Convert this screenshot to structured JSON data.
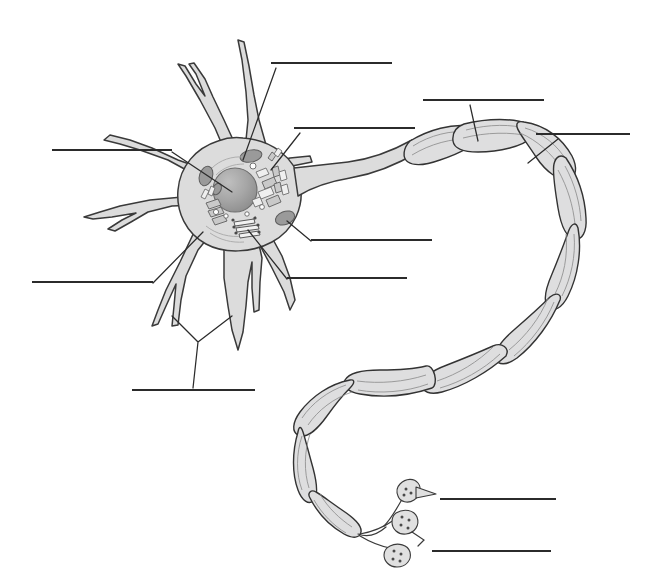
{
  "figure": {
    "background_color": "#ffffff",
    "line_color": "#2b2b2b",
    "cell_fill_color": "#dcdcdc",
    "organelle_dark_color": "#9a9a9a",
    "myelin_fill_color": "#dededf"
  },
  "label_lines": [
    {
      "id": "label-line-1",
      "text": "",
      "position": "top-center",
      "x1": 271,
      "y1": 63,
      "x2": 392,
      "y2": 63,
      "points_to": "dendrite"
    },
    {
      "id": "label-line-2",
      "text": "",
      "position": "upper-center-right",
      "x1": 294,
      "y1": 128,
      "x2": 415,
      "y2": 128,
      "points_to": "rough-endoplasmic-reticulum"
    },
    {
      "id": "label-line-3",
      "text": "",
      "position": "upper-right",
      "x1": 423,
      "y1": 100,
      "x2": 544,
      "y2": 100,
      "points_to": "myelin-sheath"
    },
    {
      "id": "label-line-4",
      "text": "",
      "position": "right",
      "x1": 536,
      "y1": 134,
      "x2": 630,
      "y2": 134,
      "points_to": "node-of-ranvier"
    },
    {
      "id": "label-line-5",
      "text": "",
      "position": "left-upper",
      "x1": 52,
      "y1": 150,
      "x2": 172,
      "y2": 150,
      "points_to": "nucleus"
    },
    {
      "id": "label-line-6",
      "text": "",
      "position": "center-right",
      "x1": 311,
      "y1": 240,
      "x2": 432,
      "y2": 240,
      "points_to": "mitochondrion"
    },
    {
      "id": "label-line-7",
      "text": "",
      "position": "center-right-lower",
      "x1": 287,
      "y1": 278,
      "x2": 407,
      "y2": 278,
      "points_to": "golgi-apparatus"
    },
    {
      "id": "label-line-8",
      "text": "",
      "position": "left-lower",
      "x1": 32,
      "y1": 282,
      "x2": 153,
      "y2": 282,
      "points_to": "cell-body-soma"
    },
    {
      "id": "label-line-9",
      "text": "",
      "position": "bottom-left",
      "x1": 132,
      "y1": 390,
      "x2": 255,
      "y2": 390,
      "points_to": "dendrites"
    },
    {
      "id": "label-line-10",
      "text": "",
      "position": "bottom-right-upper",
      "x1": 440,
      "y1": 499,
      "x2": 556,
      "y2": 499,
      "points_to": "axon-terminal"
    },
    {
      "id": "label-line-11",
      "text": "",
      "position": "bottom-right-lower",
      "x1": 432,
      "y1": 551,
      "x2": 551,
      "y2": 551,
      "points_to": "synaptic-knob"
    }
  ],
  "structures": [
    {
      "id": "cell-body",
      "name": "cell body (soma)"
    },
    {
      "id": "nucleus",
      "name": "nucleus"
    },
    {
      "id": "dendrites",
      "name": "dendrites",
      "count": 8
    },
    {
      "id": "axon-hillock",
      "name": "axon hillock"
    },
    {
      "id": "axon",
      "name": "axon"
    },
    {
      "id": "myelin-sheath",
      "name": "myelin sheath (Schwann cells)",
      "segments": 11
    },
    {
      "id": "node-of-ranvier",
      "name": "node of Ranvier"
    },
    {
      "id": "mitochondria",
      "name": "mitochondria",
      "count": 4
    },
    {
      "id": "rough-er",
      "name": "rough endoplasmic reticulum / Nissl bodies"
    },
    {
      "id": "golgi-apparatus",
      "name": "Golgi apparatus"
    },
    {
      "id": "axon-terminals",
      "name": "axon terminals / synaptic knobs",
      "count": 3
    }
  ]
}
